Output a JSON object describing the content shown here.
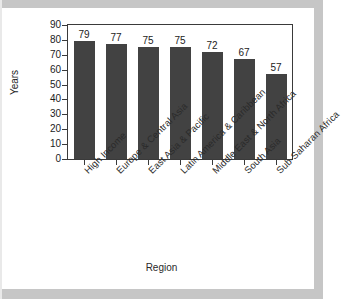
{
  "chart_data": {
    "type": "bar",
    "title": "",
    "xlabel": "Region",
    "ylabel": "Years",
    "categories": [
      "High Income",
      "Europe & Central Asia",
      "East Asia & Pacific",
      "Latin America & Caribbean",
      "Middle East & North Africa",
      "South Asia",
      "Sub-Saharan Africa"
    ],
    "values": [
      79,
      77,
      75,
      75,
      72,
      67,
      57
    ],
    "data_labels": [
      "79",
      "77",
      "75",
      "75",
      "72",
      "67",
      "57"
    ],
    "ylim": [
      0,
      90
    ],
    "ytick_values": [
      0,
      10,
      20,
      30,
      40,
      50,
      60,
      70,
      80,
      90
    ],
    "ytick_labels": [
      "0",
      "10",
      "20",
      "30",
      "40",
      "50",
      "60",
      "70",
      "80",
      "90"
    ],
    "grid": false,
    "legend": null,
    "bar_color": "#424242",
    "axis_color": "#3a3a3a",
    "background_color": "#ffffff"
  }
}
